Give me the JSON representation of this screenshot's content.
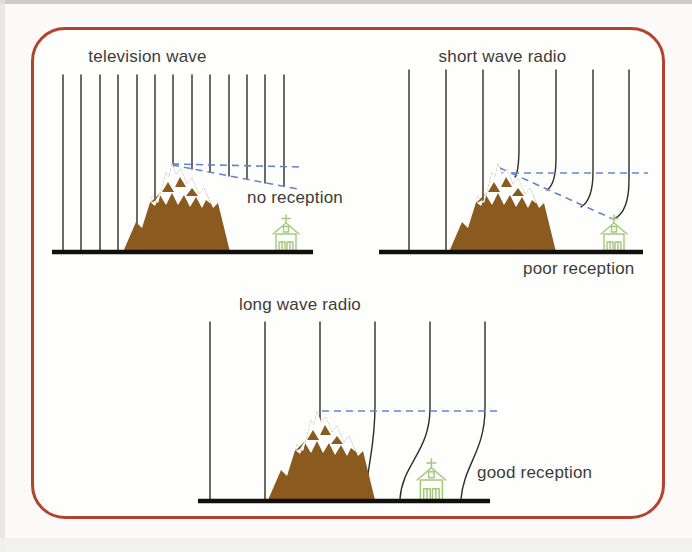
{
  "figure": {
    "kind": "wave-diffraction-diagram",
    "panels": [
      {
        "id": "television",
        "title": "television wave",
        "reception_label": "no reception",
        "wavefront_count": 13,
        "wavefront_spacing_px": 18,
        "wavefront_style": "straight",
        "dashed_guides": [
          "peak-height line",
          "shadow boundary to receiver"
        ]
      },
      {
        "id": "short-wave",
        "title": "short wave radio",
        "reception_label": "poor reception",
        "wavefront_count": 7,
        "wavefront_spacing_px": 37,
        "wavefront_style": "slightly-bent",
        "dashed_guides": [
          "peak-height line",
          "shadow boundary to receiver"
        ]
      },
      {
        "id": "long-wave",
        "title": "long wave radio",
        "reception_label": "good reception",
        "wavefront_count": 6,
        "wavefront_spacing_px": 55,
        "wavefront_style": "strongly-bent",
        "dashed_guides": [
          "peak-height line"
        ]
      }
    ],
    "colors": {
      "border": "#b2432c",
      "mountain": "#8a5a1f",
      "snow": "#ffffff",
      "wave_line": "#2e2c27",
      "dashed_line": "#6285c6",
      "ground": "#12100d",
      "house": "#a2c87c",
      "text": "#3d3c38"
    }
  }
}
